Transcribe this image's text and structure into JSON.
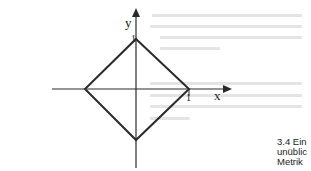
{
  "diagram": {
    "axes": {
      "x_label": "x",
      "y_label": "y"
    },
    "ticks": {
      "x_one": "1",
      "y_one": "1"
    },
    "shape": "diamond",
    "colors": {
      "line": "#2a2a2a",
      "bleed_through": "#e4e4e4"
    }
  },
  "caption": {
    "line1": "3.4 Ein",
    "line2": "unüblic",
    "line3": "Metrik"
  }
}
